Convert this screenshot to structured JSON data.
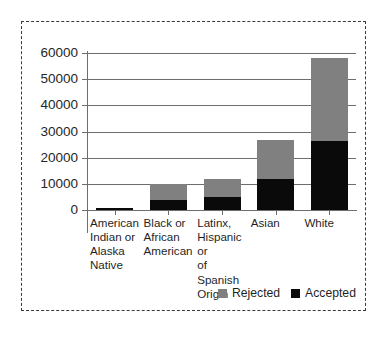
{
  "chart_data": {
    "type": "bar",
    "subtype": "stacked-vertical",
    "title": "",
    "xlabel": "",
    "ylabel": "",
    "ylim": [
      0,
      60000
    ],
    "yticks": [
      0,
      10000,
      20000,
      30000,
      40000,
      50000,
      60000
    ],
    "ytick_labels": [
      "0",
      "10000",
      "20000",
      "30000",
      "40000",
      "50000",
      "60000"
    ],
    "grid": "horizontal",
    "legend_position": "bottom-right",
    "stack_order": [
      "Accepted",
      "Rejected"
    ],
    "categories": [
      "American Indian or Alaska Native",
      "Black or African American",
      "Latinx, Hispanic or of Spanish Origin",
      "Asian",
      "White"
    ],
    "category_label_lines": [
      [
        "American",
        "Indian or",
        "Alaska",
        "Native"
      ],
      [
        "Black or",
        "African",
        "American"
      ],
      [
        "Latinx,",
        "Hispanic or",
        "of Spanish",
        "Origin"
      ],
      [
        "Asian"
      ],
      [
        "White"
      ]
    ],
    "series": [
      {
        "name": "Accepted",
        "color": "#0a0a0a",
        "values": [
          700,
          3800,
          5000,
          11700,
          26300
        ]
      },
      {
        "name": "Rejected",
        "color": "#808080",
        "values": [
          100,
          6200,
          6800,
          15100,
          31900
        ]
      }
    ],
    "totals": [
      800,
      10000,
      11800,
      26800,
      58200
    ]
  },
  "legend": {
    "items": [
      {
        "label": "Rejected",
        "color": "#808080"
      },
      {
        "label": "Accepted",
        "color": "#0a0a0a"
      }
    ]
  },
  "colors": {
    "rejected": "#808080",
    "accepted": "#0a0a0a",
    "axis": "#6e6e6e",
    "text": "#1f1f1f",
    "frame_border": "#3a3a3a",
    "background": "#ffffff"
  }
}
